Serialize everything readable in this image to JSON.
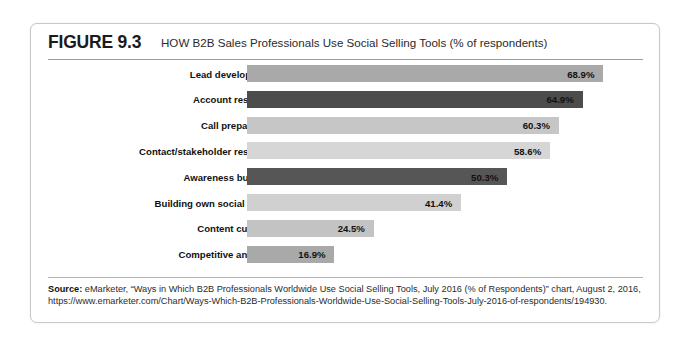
{
  "figure": {
    "label": "FIGURE 9.3",
    "title": "HOW B2B Sales Professionals Use Social Selling Tools (% of respondents)"
  },
  "source": {
    "prefix": "Source:",
    "text": " eMarketer, “Ways in Which B2B Professionals Worldwide Use Social Selling Tools, July 2016 (% of Respondents)” chart, August 2, 2016, https://www.emarketer.com/Chart/Ways-Which-B2B-Professionals-Worldwide-Use-Social-Selling-Tools-July-2016-of-respondents/194930."
  },
  "chart_data": {
    "type": "bar",
    "orientation": "horizontal",
    "title": "HOW B2B Sales Professionals Use Social Selling Tools (% of respondents)",
    "xlabel": "",
    "ylabel": "",
    "xlim": [
      0,
      70
    ],
    "grid": false,
    "legend": "none",
    "value_suffix": "%",
    "categories": [
      "Lead development",
      "Account research",
      "Call preparation",
      "Contact/stakeholder research",
      "Awareness building",
      "Building own social brand",
      "Content curation",
      "Competitive analysis"
    ],
    "values": [
      68.9,
      64.9,
      60.3,
      58.6,
      50.3,
      41.4,
      24.5,
      16.9
    ],
    "value_labels": [
      "68.9%",
      "64.9%",
      "60.3%",
      "58.6%",
      "50.3%",
      "41.4%",
      "24.5%",
      "16.9%"
    ],
    "bar_colors": [
      "#a9a9a9",
      "#4c4c4c",
      "#c6c6c6",
      "#d6d6d6",
      "#565656",
      "#d0d0d0",
      "#c3c3c3",
      "#a9a9a9"
    ]
  }
}
